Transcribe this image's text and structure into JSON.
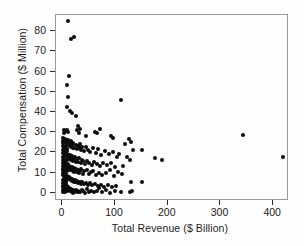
{
  "chart_data": {
    "type": "scatter",
    "title": "",
    "xlabel": "Total Revenue ($ Billion)",
    "ylabel": "Total Compensation ($ Million)",
    "xlim": [
      -12,
      430
    ],
    "ylim": [
      -4,
      88
    ],
    "xticks": [
      0,
      100,
      200,
      300,
      400
    ],
    "xtick_labels": [
      "0",
      "100",
      "200",
      "300",
      "400"
    ],
    "yticks": [
      0,
      10,
      20,
      30,
      40,
      50,
      60,
      70,
      80
    ],
    "ytick_labels": [
      "0",
      "10",
      "20",
      "30",
      "40",
      "50",
      "60",
      "70",
      "80"
    ],
    "grid": false,
    "legend": null,
    "marker": {
      "shape": "circle",
      "color": "#0c0c0c",
      "size": 4
    },
    "n_points": 268,
    "points": [
      [
        10,
        85.0
      ],
      [
        16,
        76.2
      ],
      [
        23,
        77.3
      ],
      [
        13,
        57.8
      ],
      [
        8,
        53.3
      ],
      [
        10,
        47.4
      ],
      [
        9,
        42.3
      ],
      [
        14,
        40.3
      ],
      [
        19,
        39.4
      ],
      [
        25,
        38.2
      ],
      [
        112,
        46.1
      ],
      [
        3,
        31.0
      ],
      [
        6,
        30.4
      ],
      [
        4,
        29.6
      ],
      [
        8,
        31.2
      ],
      [
        11,
        30.1
      ],
      [
        28,
        31.0
      ],
      [
        30,
        33.2
      ],
      [
        32,
        29.8
      ],
      [
        34,
        31.6
      ],
      [
        44,
        28.4
      ],
      [
        62,
        30.3
      ],
      [
        66,
        29.4
      ],
      [
        72,
        31.5
      ],
      [
        92,
        28.1
      ],
      [
        96,
        27.2
      ],
      [
        342,
        28.5
      ],
      [
        419,
        18.0
      ],
      [
        2,
        27.1
      ],
      [
        3,
        26.4
      ],
      [
        4,
        25.8
      ],
      [
        5,
        26.9
      ],
      [
        6,
        25.2
      ],
      [
        7,
        26.1
      ],
      [
        8,
        24.7
      ],
      [
        9,
        25.5
      ],
      [
        10,
        24.1
      ],
      [
        11,
        26.3
      ],
      [
        12,
        23.6
      ],
      [
        13,
        25.0
      ],
      [
        14,
        24.4
      ],
      [
        15,
        23.2
      ],
      [
        16,
        25.7
      ],
      [
        17,
        22.8
      ],
      [
        18,
        24.0
      ],
      [
        19,
        23.5
      ],
      [
        20,
        22.1
      ],
      [
        21,
        24.6
      ],
      [
        23,
        22.4
      ],
      [
        25,
        23.8
      ],
      [
        27,
        21.7
      ],
      [
        29,
        23.1
      ],
      [
        31,
        22.0
      ],
      [
        33,
        24.2
      ],
      [
        36,
        21.3
      ],
      [
        38,
        22.6
      ],
      [
        41,
        20.8
      ],
      [
        45,
        22.9
      ],
      [
        49,
        21.1
      ],
      [
        53,
        20.3
      ],
      [
        58,
        22.2
      ],
      [
        63,
        19.7
      ],
      [
        68,
        21.5
      ],
      [
        74,
        18.9
      ],
      [
        80,
        20.6
      ],
      [
        88,
        19.1
      ],
      [
        96,
        20.1
      ],
      [
        104,
        17.8
      ],
      [
        118,
        24.3
      ],
      [
        126,
        26.5
      ],
      [
        130,
        25.1
      ],
      [
        134,
        21.2
      ],
      [
        152,
        21.4
      ],
      [
        176,
        17.5
      ],
      [
        189,
        16.2
      ],
      [
        2,
        21.0
      ],
      [
        3,
        20.2
      ],
      [
        4,
        19.4
      ],
      [
        5,
        20.8
      ],
      [
        6,
        18.6
      ],
      [
        7,
        19.9
      ],
      [
        8,
        18.1
      ],
      [
        9,
        19.2
      ],
      [
        10,
        17.4
      ],
      [
        11,
        18.8
      ],
      [
        12,
        16.9
      ],
      [
        13,
        18.3
      ],
      [
        14,
        17.1
      ],
      [
        15,
        19.0
      ],
      [
        16,
        16.3
      ],
      [
        17,
        17.7
      ],
      [
        18,
        16.6
      ],
      [
        19,
        18.2
      ],
      [
        20,
        15.8
      ],
      [
        21,
        17.2
      ],
      [
        22,
        16.1
      ],
      [
        24,
        17.9
      ],
      [
        26,
        15.4
      ],
      [
        28,
        16.8
      ],
      [
        30,
        15.1
      ],
      [
        32,
        17.3
      ],
      [
        35,
        14.7
      ],
      [
        37,
        16.4
      ],
      [
        40,
        15.6
      ],
      [
        43,
        14.2
      ],
      [
        47,
        16.0
      ],
      [
        51,
        14.9
      ],
      [
        56,
        13.8
      ],
      [
        61,
        15.3
      ],
      [
        66,
        14.4
      ],
      [
        71,
        13.2
      ],
      [
        78,
        15.0
      ],
      [
        85,
        13.6
      ],
      [
        93,
        14.8
      ],
      [
        100,
        12.7
      ],
      [
        108,
        19.2
      ],
      [
        115,
        13.1
      ],
      [
        122,
        17.6
      ],
      [
        129,
        16.3
      ],
      [
        2,
        14.6
      ],
      [
        3,
        13.9
      ],
      [
        4,
        15.2
      ],
      [
        5,
        13.3
      ],
      [
        6,
        14.1
      ],
      [
        7,
        12.8
      ],
      [
        8,
        13.7
      ],
      [
        9,
        12.4
      ],
      [
        10,
        14.3
      ],
      [
        11,
        12.1
      ],
      [
        12,
        13.4
      ],
      [
        13,
        11.8
      ],
      [
        14,
        12.9
      ],
      [
        15,
        11.5
      ],
      [
        16,
        13.0
      ],
      [
        17,
        12.2
      ],
      [
        18,
        11.1
      ],
      [
        19,
        12.6
      ],
      [
        20,
        10.8
      ],
      [
        21,
        11.9
      ],
      [
        22,
        12.3
      ],
      [
        23,
        10.5
      ],
      [
        25,
        11.6
      ],
      [
        27,
        10.2
      ],
      [
        29,
        11.3
      ],
      [
        31,
        9.9
      ],
      [
        34,
        10.9
      ],
      [
        36,
        12.0
      ],
      [
        39,
        9.6
      ],
      [
        42,
        10.6
      ],
      [
        46,
        11.4
      ],
      [
        50,
        9.3
      ],
      [
        54,
        10.3
      ],
      [
        59,
        11.0
      ],
      [
        64,
        9.0
      ],
      [
        69,
        10.0
      ],
      [
        75,
        8.7
      ],
      [
        82,
        9.7
      ],
      [
        90,
        11.2
      ],
      [
        98,
        8.4
      ],
      [
        106,
        10.4
      ],
      [
        113,
        9.2
      ],
      [
        2,
        8.9
      ],
      [
        3,
        9.5
      ],
      [
        4,
        8.2
      ],
      [
        5,
        9.1
      ],
      [
        6,
        7.9
      ],
      [
        7,
        8.6
      ],
      [
        8,
        7.6
      ],
      [
        9,
        8.3
      ],
      [
        10,
        7.3
      ],
      [
        11,
        8.0
      ],
      [
        12,
        7.0
      ],
      [
        13,
        7.7
      ],
      [
        14,
        6.7
      ],
      [
        15,
        7.4
      ],
      [
        16,
        6.4
      ],
      [
        17,
        7.1
      ],
      [
        18,
        6.1
      ],
      [
        19,
        6.8
      ],
      [
        20,
        5.8
      ],
      [
        21,
        6.5
      ],
      [
        22,
        5.5
      ],
      [
        24,
        6.2
      ],
      [
        26,
        5.2
      ],
      [
        28,
        5.9
      ],
      [
        30,
        4.9
      ],
      [
        33,
        5.6
      ],
      [
        35,
        4.6
      ],
      [
        38,
        5.3
      ],
      [
        41,
        4.3
      ],
      [
        44,
        5.0
      ],
      [
        48,
        4.0
      ],
      [
        52,
        4.7
      ],
      [
        57,
        3.7
      ],
      [
        62,
        4.4
      ],
      [
        67,
        3.4
      ],
      [
        73,
        4.1
      ],
      [
        79,
        3.1
      ],
      [
        86,
        3.8
      ],
      [
        94,
        2.8
      ],
      [
        101,
        3.5
      ],
      [
        131,
        5.4
      ],
      [
        152,
        5.6
      ],
      [
        2,
        3.2
      ],
      [
        3,
        2.9
      ],
      [
        4,
        3.6
      ],
      [
        5,
        2.6
      ],
      [
        6,
        3.3
      ],
      [
        7,
        2.3
      ],
      [
        8,
        3.0
      ],
      [
        9,
        2.0
      ],
      [
        10,
        2.7
      ],
      [
        11,
        1.7
      ],
      [
        12,
        2.4
      ],
      [
        13,
        1.4
      ],
      [
        14,
        2.1
      ],
      [
        15,
        1.1
      ],
      [
        16,
        1.8
      ],
      [
        17,
        0.8
      ],
      [
        18,
        1.5
      ],
      [
        19,
        0.5
      ],
      [
        20,
        1.2
      ],
      [
        21,
        0.2
      ],
      [
        22,
        0.9
      ],
      [
        23,
        0.6
      ],
      [
        25,
        1.3
      ],
      [
        27,
        0.3
      ],
      [
        29,
        1.0
      ],
      [
        31,
        0.7
      ],
      [
        34,
        0.4
      ],
      [
        37,
        1.6
      ],
      [
        40,
        0.9
      ],
      [
        43,
        0.1
      ],
      [
        47,
        1.9
      ],
      [
        51,
        0.6
      ],
      [
        55,
        1.1
      ],
      [
        60,
        0.3
      ],
      [
        65,
        0.8
      ],
      [
        70,
        2.2
      ],
      [
        76,
        0.5
      ],
      [
        83,
        1.4
      ],
      [
        91,
        0.2
      ],
      [
        99,
        0.9
      ],
      [
        112,
        0.4
      ],
      [
        128,
        0.7
      ],
      [
        133,
        1.0
      ],
      [
        1,
        23.3
      ],
      [
        1,
        19.8
      ],
      [
        1,
        16.5
      ],
      [
        1,
        13.2
      ],
      [
        1,
        9.8
      ],
      [
        1,
        6.5
      ],
      [
        1,
        3.1
      ],
      [
        1,
        0.4
      ],
      [
        1,
        25.9
      ],
      [
        1,
        11.4
      ],
      [
        2,
        24.9
      ],
      [
        2,
        18.0
      ],
      [
        2,
        11.7
      ],
      [
        2,
        5.1
      ],
      [
        2,
        1.5
      ],
      [
        3,
        22.7
      ],
      [
        3,
        17.2
      ],
      [
        3,
        10.1
      ],
      [
        3,
        4.4
      ],
      [
        3,
        0.8
      ],
      [
        4,
        21.9
      ],
      [
        4,
        12.5
      ],
      [
        4,
        6.9
      ],
      [
        4,
        1.9
      ],
      [
        5,
        23.0
      ],
      [
        5,
        15.9
      ],
      [
        5,
        8.8
      ],
      [
        5,
        4.1
      ],
      [
        5,
        0.3
      ],
      [
        6,
        21.4
      ],
      [
        6,
        10.7
      ],
      [
        6,
        5.7
      ],
      [
        6,
        2.2
      ],
      [
        7,
        22.5
      ],
      [
        7,
        14.5
      ],
      [
        7,
        9.4
      ],
      [
        7,
        4.8
      ],
      [
        8,
        20.5
      ],
      [
        8,
        16.1
      ],
      [
        8,
        11.0
      ],
      [
        8,
        3.5
      ],
      [
        9,
        21.6
      ],
      [
        9,
        14.0
      ],
      [
        9,
        6.2
      ],
      [
        9,
        1.0
      ]
    ]
  },
  "axes": {
    "x_title": "Total Revenue ($ Billion)",
    "y_title": "Total Compensation ($ Million)"
  }
}
